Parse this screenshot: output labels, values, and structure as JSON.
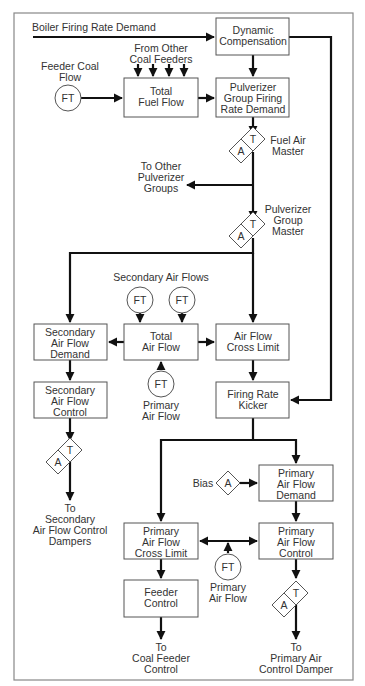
{
  "diagram": {
    "colors": {
      "line": "#111111",
      "box_border": "#555555",
      "text": "#333333",
      "frame": "#888888",
      "background": "#ffffff"
    },
    "inputs": {
      "boiler_firing_rate_demand": "Boiler Firing Rate Demand",
      "feeder_coal_flow": [
        "Feeder Coal",
        "Flow"
      ],
      "from_other_coal_feeders": [
        "From Other",
        "Coal Feeders"
      ],
      "secondary_air_flows": "Secondary Air Flows",
      "primary_air_flow_1": [
        "Primary",
        "Air Flow"
      ],
      "primary_air_flow_2": [
        "Primary",
        "Air Flow"
      ],
      "bias": "Bias"
    },
    "transmitter_label": "FT",
    "station": {
      "auto": "A",
      "transfer": "T"
    },
    "stations": {
      "fuel_air_master": [
        "Fuel Air",
        "Master"
      ],
      "pulverizer_group_master": [
        "Pulverizer",
        "Group",
        "Master"
      ]
    },
    "blocks": {
      "dynamic_compensation": [
        "Dynamic",
        "Compensation"
      ],
      "total_fuel_flow": [
        "Total",
        "Fuel Flow"
      ],
      "pulverizer_group_firing_rate_demand": [
        "Pulverizer",
        "Group Firing",
        "Rate Demand"
      ],
      "secondary_air_flow_demand": [
        "Secondary",
        "Air Flow",
        "Demand"
      ],
      "total_air_flow": [
        "Total",
        "Air Flow"
      ],
      "air_flow_cross_limit": [
        "Air Flow",
        "Cross Limit"
      ],
      "secondary_air_flow_control": [
        "Secondary",
        "Air Flow",
        "Control"
      ],
      "firing_rate_kicker": [
        "Firing Rate",
        "Kicker"
      ],
      "primary_air_flow_demand": [
        "Primary",
        "Air Flow",
        "Demand"
      ],
      "primary_air_flow_cross_limit": [
        "Primary",
        "Air Flow",
        "Cross Limit"
      ],
      "primary_air_flow_control": [
        "Primary",
        "Air Flow",
        "Control"
      ],
      "feeder_control": [
        "Feeder",
        "Control"
      ]
    },
    "outputs": {
      "to_other_pulverizer_groups": [
        "To Other",
        "Pulverizer",
        "Groups"
      ],
      "to_secondary_air_flow_control_dampers": [
        "To",
        "Secondary",
        "Air Flow Control",
        "Dampers"
      ],
      "to_coal_feeder_control": [
        "To",
        "Coal Feeder",
        "Control"
      ],
      "to_primary_air_control_damper": [
        "To",
        "Primary Air",
        "Control Damper"
      ]
    }
  }
}
